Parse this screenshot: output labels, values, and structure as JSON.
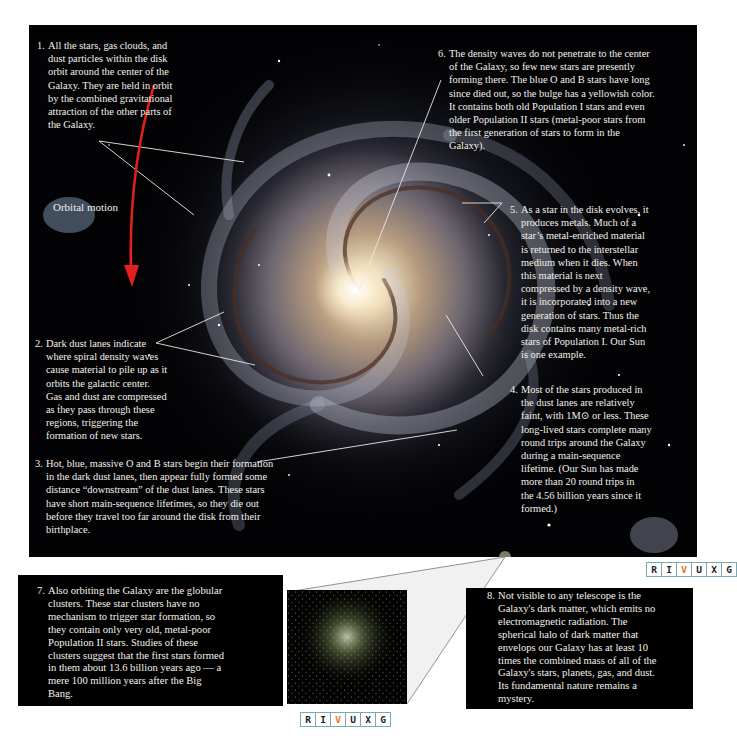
{
  "figure": {
    "callouts": [
      {
        "num": "1.",
        "lines": [
          "All the stars, gas clouds, and",
          "dust particles within the disk",
          "orbit around the center of the",
          "Galaxy. They are held in orbit",
          "by the combined gravitational",
          "attraction of the other parts of",
          "the Galaxy."
        ]
      },
      {
        "num": "2.",
        "lines": [
          "Dark dust lanes indicate",
          "where spiral density waves",
          "cause material to pile up as it",
          "orbits the galactic center.",
          "Gas and dust are compressed",
          "as they pass through these",
          "regions, triggering the",
          "formation of new stars."
        ]
      },
      {
        "num": "3.",
        "lines": [
          "Hot, blue, massive O and B stars begin their formation",
          "in the dark dust lanes, then appear fully formed some",
          "distance “downstream” of the dust lanes. These stars",
          "have short main-sequence lifetimes, so they die out",
          "before they travel too far around the disk from their",
          "birthplace."
        ]
      },
      {
        "num": "4.",
        "lines": [
          "Most of the stars produced in",
          "the dust lanes are relatively",
          "faint, with 1M⊙ or less. These",
          "long-lived stars complete many",
          "round trips around the Galaxy",
          "during a main-sequence",
          "lifetime. (Our Sun has made",
          "more than 20 round trips in",
          "the 4.56 billion years since it",
          "formed.)"
        ]
      },
      {
        "num": "5.",
        "lines": [
          "As a star in the disk evolves, it",
          "produces metals. Much of a",
          "star’s metal-enriched material",
          "is returned to the interstellar",
          "medium when it dies. When",
          "this material is next",
          "compressed by a density wave,",
          "it is incorporated into a new",
          "generation of stars. Thus the",
          "disk contains many metal-rich",
          "stars of Population I. Our Sun",
          "is one example."
        ]
      },
      {
        "num": "6.",
        "lines": [
          "The density waves do not penetrate to the center",
          "of the Galaxy, so few new stars are presently",
          "forming there. The blue O and B stars have long",
          "since died out, so the bulge has a yellowish color.",
          "It contains both old Population I stars and even",
          "older Population II stars (metal-poor stars from",
          "the first generation of stars to form in the",
          "Galaxy)."
        ]
      },
      {
        "num": "7.",
        "lines": [
          "Also orbiting the Galaxy are the globular",
          "clusters. These star clusters have no",
          "mechanism to trigger star formation, so",
          "they contain only very old, metal-poor",
          "Population II stars. Studies of these",
          "clusters suggest that the first stars formed",
          "in them about 13.6 billion years ago — a",
          "mere 100 million years after the Big",
          "Bang."
        ]
      },
      {
        "num": "8.",
        "lines": [
          "Not visible to any telescope is the",
          "Galaxy's dark matter, which emits no",
          "electromagnetic radiation. The",
          "spherical halo of dark matter that",
          "envelops our Galaxy has at least 10",
          "times the combined mass of all of the",
          "Galaxy's stars, planets, gas, and dust.",
          "Its fundamental nature remains a",
          "mystery."
        ]
      }
    ],
    "orbital_label": "Orbital motion",
    "wavelength_badge": {
      "letters": [
        "R",
        "I",
        "V",
        "U",
        "X",
        "G"
      ],
      "active": "V"
    },
    "colors": {
      "background": "#030305",
      "text": "#f4f1ea",
      "arrow": "#e3201b",
      "badge_border": "#7aa9b4",
      "badge_active": "#e07b22"
    }
  }
}
